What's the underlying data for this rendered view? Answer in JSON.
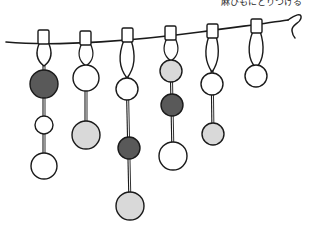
{
  "illustration": {
    "title": "hanging-beaded-strands-on-hemp-cord",
    "caption": "麻ひもにとりつける",
    "background_color": "#ffffff",
    "ink_color": "#1a1a1a",
    "palette": {
      "white_bead": "#ffffff",
      "light_gray_bead": "#d9d9d9",
      "dark_gray_bead": "#595959",
      "outline": "#1a1a1a",
      "cord": "#1a1a1a"
    },
    "cord": {
      "name": "hemp-cord",
      "start": {
        "x": 6,
        "y": 42
      },
      "end": {
        "x": 292,
        "y": 22
      },
      "sag": 6,
      "end_curl": "loop"
    },
    "strands": [
      {
        "id": 1,
        "clip_x": 43,
        "clip_y": 33,
        "loop_length": 32,
        "beads": [
          {
            "shade": "dark",
            "radius": 14,
            "cy": 84
          },
          {
            "shade": "white",
            "radius": 9,
            "cy": 125
          },
          {
            "shade": "white",
            "radius": 13,
            "cy": 166
          }
        ]
      },
      {
        "id": 2,
        "clip_x": 85,
        "clip_y": 34,
        "loop_length": 30,
        "beads": [
          {
            "shade": "white",
            "radius": 13,
            "cy": 78
          },
          {
            "shade": "light",
            "radius": 14,
            "cy": 135
          }
        ]
      },
      {
        "id": 3,
        "clip_x": 128,
        "clip_y": 31,
        "loop_length": 41,
        "beads": [
          {
            "shade": "white",
            "radius": 11,
            "cy": 89
          },
          {
            "shade": "dark",
            "radius": 11,
            "cy": 148
          },
          {
            "shade": "light",
            "radius": 14,
            "cy": 206
          }
        ]
      },
      {
        "id": 4,
        "clip_x": 170,
        "clip_y": 29,
        "loop_length": 26,
        "beads": [
          {
            "shade": "light",
            "radius": 11,
            "cy": 71
          },
          {
            "shade": "dark",
            "radius": 11,
            "cy": 105
          },
          {
            "shade": "white",
            "radius": 14,
            "cy": 156
          }
        ]
      },
      {
        "id": 5,
        "clip_x": 212,
        "clip_y": 27,
        "loop_length": 34,
        "beads": [
          {
            "shade": "white",
            "radius": 11,
            "cy": 84
          },
          {
            "shade": "light",
            "radius": 11,
            "cy": 134
          }
        ]
      },
      {
        "id": 6,
        "clip_x": 257,
        "clip_y": 22,
        "loop_length": 37,
        "beads": [
          {
            "shade": "white",
            "radius": 11,
            "cy": 76
          }
        ]
      }
    ],
    "bead_counts": {
      "total": 14,
      "white": 6,
      "light_gray": 5,
      "dark_gray": 3
    }
  }
}
